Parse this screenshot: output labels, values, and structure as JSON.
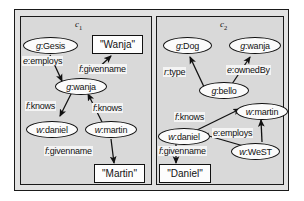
{
  "diagram": {
    "contexts": [
      {
        "id": "c1",
        "label_main": "c",
        "label_sub": "1"
      },
      {
        "id": "c2",
        "label_main": "c",
        "label_sub": "2"
      }
    ],
    "c1": {
      "nodes": [
        {
          "name": "node-g-gesis",
          "prefix": "g",
          "sep": ":",
          "local": "Gesis"
        },
        {
          "name": "node-g-wanja",
          "prefix": "g",
          "sep": ":",
          "local": "wanja"
        },
        {
          "name": "node-w-daniel",
          "prefix": "w",
          "sep": ":",
          "local": "daniel"
        },
        {
          "name": "node-w-martin",
          "prefix": "w",
          "sep": ":",
          "local": "martin"
        }
      ],
      "literals": [
        {
          "name": "literal-wanja",
          "text": "\"Wanja\""
        },
        {
          "name": "literal-martin",
          "text": "\"Martin\""
        }
      ],
      "edges": [
        {
          "name": "edge-employs",
          "prefix": "e",
          "sep": ":",
          "local": "employs",
          "from": "g:Gesis",
          "to": "g:wanja"
        },
        {
          "name": "edge-givenname-1",
          "prefix": "f",
          "sep": ":",
          "local": "givenname",
          "from": "g:wanja",
          "to": "\"Wanja\""
        },
        {
          "name": "edge-knows-1",
          "prefix": "f",
          "sep": ":",
          "local": "knows",
          "from": "g:wanja",
          "to": "w:daniel"
        },
        {
          "name": "edge-knows-2",
          "prefix": "f",
          "sep": ":",
          "local": "knows",
          "from": "w:martin",
          "to": "g:wanja"
        },
        {
          "name": "edge-givenname-2",
          "prefix": "f",
          "sep": ":",
          "local": "givenname",
          "from": "w:martin",
          "to": "\"Martin\""
        }
      ]
    },
    "c2": {
      "nodes": [
        {
          "name": "node-g-dog",
          "prefix": "g",
          "sep": ":",
          "local": "Dog"
        },
        {
          "name": "node-g-wanja2",
          "prefix": "g",
          "sep": ":",
          "local": "wanja"
        },
        {
          "name": "node-g-bello",
          "prefix": "g",
          "sep": ":",
          "local": "bello"
        },
        {
          "name": "node-w-martin2",
          "prefix": "w",
          "sep": ":",
          "local": "martin"
        },
        {
          "name": "node-w-daniel2",
          "prefix": "w",
          "sep": ":",
          "local": "daniel"
        },
        {
          "name": "node-w-west",
          "prefix": "w",
          "sep": ":",
          "local": "WeST"
        }
      ],
      "literals": [
        {
          "name": "literal-daniel",
          "text": "\"Daniel\""
        }
      ],
      "edges": [
        {
          "name": "edge-type",
          "prefix": "r",
          "sep": ":",
          "local": "type",
          "from": "g:bello",
          "to": "g:Dog"
        },
        {
          "name": "edge-ownedby",
          "prefix": "e",
          "sep": ":",
          "local": "ownedBy",
          "from": "g:bello",
          "to": "g:wanja"
        },
        {
          "name": "edge-knows-3",
          "prefix": "f",
          "sep": ":",
          "local": "knows",
          "from": "w:daniel",
          "to": "w:martin"
        },
        {
          "name": "edge-employs-2",
          "prefix": "e",
          "sep": ":",
          "local": "employs",
          "from": "w:WeST",
          "to": "w:daniel"
        },
        {
          "name": "edge-employs-3",
          "prefix": "e",
          "sep": ":",
          "local": "employs",
          "from": "w:WeST",
          "to": "w:martin"
        },
        {
          "name": "edge-givenname-3",
          "prefix": "f",
          "sep": ":",
          "local": "givenname",
          "from": "w:daniel",
          "to": "\"Daniel\""
        }
      ]
    },
    "colors": {
      "outer_bg": "#e2e2e2",
      "context_bg": "#d9d9d9",
      "node_fill": "#fbfbfb",
      "stroke": "#111111"
    }
  }
}
